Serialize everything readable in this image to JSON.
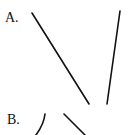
{
  "figure": {
    "parts": [
      {
        "label": "A.",
        "strokes": [
          {
            "type": "line",
            "x1": 32,
            "y1": 13,
            "x2": 89,
            "y2": 104
          },
          {
            "type": "line",
            "x1": 120,
            "y1": 11,
            "x2": 107,
            "y2": 104
          }
        ]
      },
      {
        "label": "B.",
        "strokes": [
          {
            "type": "curve",
            "start": [
              45,
              114
            ],
            "end": [
              36,
              135
            ]
          },
          {
            "type": "line",
            "x1": 64,
            "y1": 114,
            "x2": 85,
            "y2": 135
          }
        ]
      }
    ],
    "stroke_color": "#111111"
  }
}
